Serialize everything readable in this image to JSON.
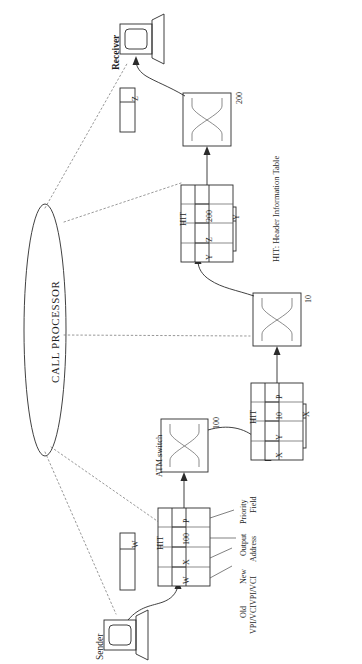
{
  "figure": {
    "orientation": "rotated-90"
  },
  "call_processor": {
    "label": "CALL PROCESSOR"
  },
  "endpoints": {
    "sender": {
      "label": "Sender",
      "icon": "monitor-icon"
    },
    "receiver": {
      "label": "Receiver",
      "icon": "monitor-icon"
    }
  },
  "caption": {
    "hit_legend": "HIT: Header Information Table"
  },
  "switch_label": "ATM switch",
  "switches": [
    {
      "id": "switch-1",
      "output_port": "100",
      "icon": "crossbar-icon"
    },
    {
      "id": "switch-2",
      "output_port": "10",
      "icon": "crossbar-icon"
    },
    {
      "id": "switch-3",
      "output_port": "200",
      "icon": "crossbar-icon"
    }
  ],
  "cells": [
    {
      "id": "cell-w",
      "value": "W"
    },
    {
      "id": "cell-x",
      "value": "X"
    },
    {
      "id": "cell-y",
      "value": "Y"
    },
    {
      "id": "cell-z",
      "value": "Z"
    }
  ],
  "hit_tables": [
    {
      "id": "hit-1",
      "title": "HIT",
      "entry": [
        "W",
        "X",
        "100",
        "P"
      ],
      "columns": [
        "Old VPI/VCI",
        "New VPI/VCI",
        "Output Address",
        "Priority Field"
      ]
    },
    {
      "id": "hit-2",
      "title": "HIT",
      "entry": [
        "X",
        "Y",
        "10",
        "P"
      ]
    },
    {
      "id": "hit-3",
      "title": "HIT",
      "entry": [
        "Y",
        "Z",
        "200",
        ""
      ]
    }
  ],
  "annotations": {
    "old_vpi_vci_line1": "Old",
    "old_vpi_vci_line2": "VPI/VCI",
    "new_vpi_vci_line1": "New",
    "new_vpi_vci_line2": "VPI/VCI",
    "output_line1": "Output",
    "output_line2": "Address",
    "priority_line1": "Priority",
    "priority_line2": "Field"
  },
  "colors": {
    "ink": "#2b2b2b",
    "dotted": "#7d7d7d",
    "paper": "#ffffff"
  }
}
